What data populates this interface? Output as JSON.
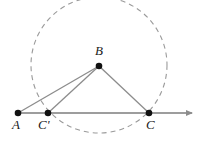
{
  "figure": {
    "width": 204,
    "height": 141,
    "background_color": "#ffffff"
  },
  "colors": {
    "stroke": "#8c8c8c",
    "point_fill": "#111111",
    "label_text": "#1a1a1a",
    "dashed_circle": "#9a9a9a",
    "baseline": "#9d9d9d"
  },
  "circle": {
    "name": "dashed-circle",
    "center_x": 99,
    "center_y": 65,
    "radius": 68,
    "dash_pattern": "5 4",
    "style": "dashed"
  },
  "points": [
    {
      "id": "A",
      "label": "A",
      "x": 18,
      "y": 113,
      "label_x": 12,
      "label_y": 118,
      "radius": 3.3
    },
    {
      "id": "Cp",
      "label": "C'",
      "x": 48,
      "y": 113,
      "label_x": 38,
      "label_y": 118,
      "radius": 3.3
    },
    {
      "id": "C",
      "label": "C",
      "x": 149,
      "y": 113,
      "label_x": 146,
      "label_y": 118,
      "radius": 3.3
    },
    {
      "id": "B",
      "label": "B",
      "x": 99,
      "y": 66,
      "label_x": 95,
      "label_y": 44,
      "radius": 3.3
    }
  ],
  "segments": [
    {
      "name": "segment-B-A",
      "x1": 99,
      "y1": 66,
      "x2": 18,
      "y2": 113
    },
    {
      "name": "segment-B-Cp",
      "x1": 99,
      "y1": 66,
      "x2": 48,
      "y2": 113
    },
    {
      "name": "segment-B-C",
      "x1": 99,
      "y1": 66,
      "x2": 149,
      "y2": 113
    }
  ],
  "ray": {
    "name": "baseline-ray",
    "x1": 18,
    "y1": 113,
    "x2": 192,
    "y2": 113,
    "arrow_at": "right",
    "arrow_tip_x": 197
  },
  "chart_data": {
    "type": "geometry-diagram",
    "elements": [
      "dashed circle centered at (99, 65) with radius 68",
      "horizontal ray from A through C' and C with arrowhead at right",
      "segment from B to A",
      "segment from B to C'",
      "segment from B to C"
    ],
    "labels": [
      "A",
      "C'",
      "C",
      "B"
    ]
  }
}
